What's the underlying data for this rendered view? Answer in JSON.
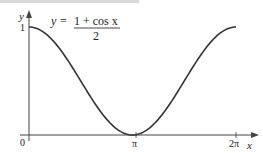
{
  "figure": {
    "equation": {
      "lhs": "y =",
      "numerator": "1 + cos x",
      "denominator": "2"
    },
    "axes": {
      "x_label": "x",
      "y_label": "y",
      "x_ticks": [
        "0",
        "π",
        "2π"
      ],
      "y_ticks": [
        "1"
      ]
    },
    "colors": {
      "curve": "#333333",
      "axes": "#444444",
      "text": "#222222"
    }
  },
  "chart_data": {
    "type": "line",
    "xlabel": "x",
    "ylabel": "y",
    "x_tick_labels": [
      "0",
      "π",
      "2π"
    ],
    "y_tick_labels": [
      "1"
    ],
    "xlim": [
      0,
      6.2832
    ],
    "ylim": [
      0,
      1
    ],
    "grid": false,
    "series": [
      {
        "name": "y = (1 + cos x)/2",
        "x": [
          0,
          0.7854,
          1.5708,
          2.3562,
          3.1416,
          3.927,
          4.7124,
          5.4978,
          6.2832
        ],
        "values": [
          1,
          0.854,
          0.5,
          0.146,
          0,
          0.146,
          0.5,
          0.854,
          1
        ]
      }
    ]
  }
}
